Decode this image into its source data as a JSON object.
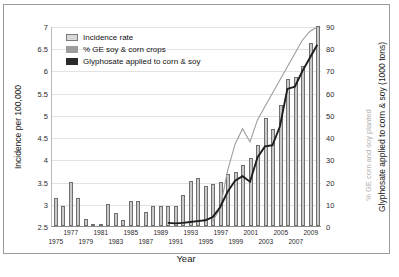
{
  "chart_data": {
    "type": "bar",
    "title": "",
    "xlabel": "Year",
    "ylabel": "Incidence per 100,000",
    "y2label": "Glyphosate applied to corn & soy (1000 tons)",
    "y2label_secondary": "% GE corn and soy planted",
    "ylim": [
      2.5,
      7
    ],
    "y2lim": [
      0,
      90
    ],
    "yticks": [
      "2.5",
      "3",
      "3.5",
      "4",
      "4.5",
      "5",
      "5.5",
      "6",
      "6.5",
      "7"
    ],
    "y2ticks": [
      "0",
      "10",
      "20",
      "30",
      "40",
      "50",
      "60",
      "70",
      "80",
      "90"
    ],
    "grid": true,
    "legend_position": "top-left",
    "x": [
      1975,
      1976,
      1977,
      1978,
      1979,
      1980,
      1981,
      1982,
      1983,
      1984,
      1985,
      1986,
      1987,
      1988,
      1989,
      1990,
      1991,
      1992,
      1993,
      1994,
      1995,
      1996,
      1997,
      1998,
      1999,
      2000,
      2001,
      2002,
      2003,
      2004,
      2005,
      2006,
      2007,
      2008,
      2009,
      2010
    ],
    "xticklabels": [
      "1975",
      "1977",
      "1979",
      "1981",
      "1983",
      "1985",
      "1987",
      "1989",
      "1991",
      "1993",
      "1995",
      "1997",
      "1999",
      "2001",
      "2003",
      "2005",
      "2007",
      "2009"
    ],
    "series": [
      {
        "name": "Incidence rate",
        "type": "bar",
        "axis": "left",
        "color": "#c9c9c9",
        "edge_color": "#6f6f6f",
        "values": [
          3.12,
          2.94,
          3.5,
          3.12,
          2.66,
          2.5,
          2.51,
          3.0,
          2.79,
          2.63,
          3.07,
          3.06,
          2.81,
          2.94,
          2.96,
          2.95,
          2.94,
          3.19,
          3.52,
          3.57,
          3.39,
          3.44,
          3.48,
          3.66,
          3.71,
          3.87,
          4.04,
          4.32,
          4.92,
          4.69,
          5.23,
          5.8,
          5.86,
          6.1,
          6.61,
          6.99
        ]
      },
      {
        "name": "% GE soy & corn crops",
        "type": "line",
        "axis": "right",
        "color": "#9d9d9d",
        "values": [
          null,
          null,
          null,
          null,
          null,
          null,
          null,
          null,
          null,
          null,
          null,
          null,
          null,
          null,
          null,
          null,
          null,
          null,
          null,
          null,
          null,
          2,
          8,
          25,
          37,
          44,
          38,
          48,
          54,
          60,
          66,
          72,
          78,
          84,
          88,
          90
        ]
      },
      {
        "name": "Glyphosate applied to corn & soy",
        "type": "line",
        "axis": "right",
        "color": "#1e1e1e",
        "values": [
          null,
          null,
          null,
          null,
          null,
          null,
          null,
          null,
          null,
          null,
          null,
          null,
          null,
          null,
          null,
          1.4,
          1.2,
          1.4,
          1.8,
          2.2,
          2.6,
          4.0,
          8.5,
          15.5,
          20.5,
          22.5,
          20.0,
          31.0,
          36.0,
          36.5,
          45.0,
          62.0,
          63.0,
          70.0,
          76.0,
          82.0
        ]
      }
    ]
  },
  "legend": {
    "items": [
      {
        "label": "Incidence rate",
        "swatch": "a"
      },
      {
        "label": "% GE soy & corn crops",
        "swatch": "b"
      },
      {
        "label": "Glyphosate applied to corn & soy",
        "swatch": "c"
      }
    ]
  },
  "caption": ""
}
